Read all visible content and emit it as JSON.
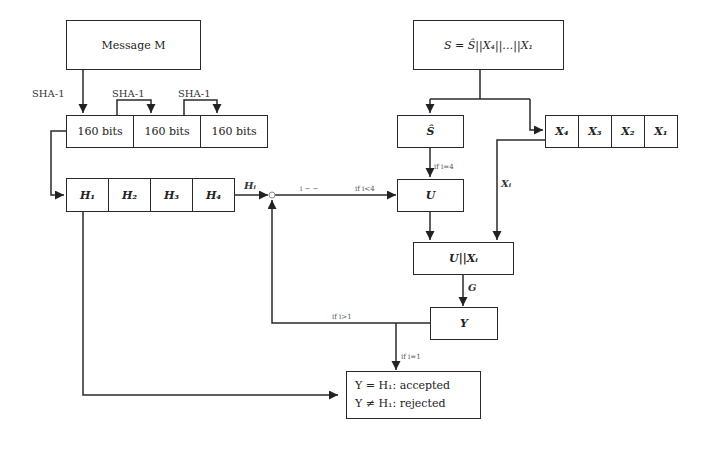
{
  "diagram": {
    "message_box": "Message M",
    "secret_box": "S = Ŝ||X₄||…||X₁",
    "hash_labels": [
      "SHA-1",
      "SHA-1",
      "SHA-1"
    ],
    "bit_blocks": [
      "160 bits",
      "160 bits",
      "160 bits"
    ],
    "h_blocks": [
      "H₁",
      "H₂",
      "H₃",
      "H₄"
    ],
    "h_output_label": "Hᵢ",
    "s_hat_box": "Ŝ",
    "x_blocks": [
      "X₄",
      "X₃",
      "X₂",
      "X₁"
    ],
    "u_box": "U",
    "concat_box": "U||Xᵢ",
    "g_label": "G",
    "y_box": "Y",
    "xi_label": "Xᵢ",
    "conditions": {
      "i_decrement": "i − −",
      "if_i_less_4": "if i<4",
      "if_i_eq_4": "if i=4",
      "if_i_greater_1": "if i>1",
      "if_i_eq_1": "if i=1"
    },
    "result_box": {
      "accepted": "Y = H₁: accepted",
      "rejected": "Y ≠ H₁: rejected"
    }
  }
}
